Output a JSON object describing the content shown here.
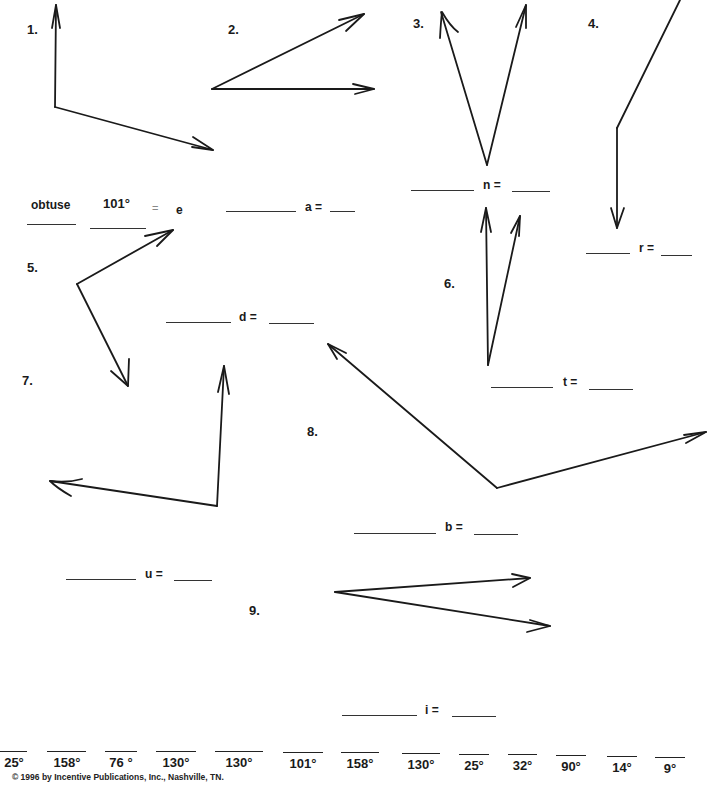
{
  "problems": [
    {
      "number": "1.",
      "label_var": "e",
      "label_text": "= e",
      "example_type": "obtuse",
      "example_measure": "101°"
    },
    {
      "number": "2.",
      "label_var": "a",
      "label_text": "a ="
    },
    {
      "number": "3.",
      "label_var": "n",
      "label_text": "n ="
    },
    {
      "number": "4.",
      "label_var": "r",
      "label_text": "r ="
    },
    {
      "number": "5.",
      "label_var": "d",
      "label_text": "d ="
    },
    {
      "number": "6.",
      "label_var": "t",
      "label_text": "t ="
    },
    {
      "number": "7.",
      "label_var": "u",
      "label_text": "u ="
    },
    {
      "number": "8.",
      "label_var": "b",
      "label_text": "b ="
    },
    {
      "number": "9.",
      "label_var": "i",
      "label_text": "i ="
    }
  ],
  "answer_bank": [
    "25°",
    "158°",
    "76 °",
    "130°",
    "130°",
    "101°",
    "158°",
    "130°",
    "25°",
    "32°",
    "90°",
    "14°",
    "9°"
  ],
  "footer": "© 1996 by Incentive Publications, Inc., Nashville, TN.",
  "colors": {
    "ink": "#1a1a1a",
    "paper": "#ffffff"
  }
}
